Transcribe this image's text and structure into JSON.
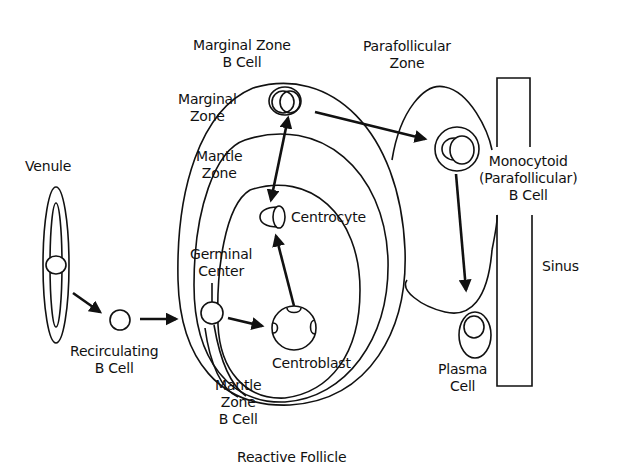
{
  "diagram": {
    "title": "Reactive Follicle",
    "labels": {
      "venule": "Venule",
      "recirculating_b_cell": [
        "Recirculating",
        "B Cell"
      ],
      "marginal_zone_b_cell": [
        "Marginal Zone",
        "B Cell"
      ],
      "marginal_zone": [
        "Marginal",
        "Zone"
      ],
      "mantle_zone": [
        "Mantle",
        "Zone"
      ],
      "germinal_center": [
        "Germinal",
        "Center"
      ],
      "centrocyte": "Centrocyte",
      "centroblast": "Centroblast",
      "mantle_zone_b_cell": [
        "Mantle",
        "Zone",
        "B Cell"
      ],
      "parafollicular_zone": [
        "Parafollicular",
        "Zone"
      ],
      "monocytoid_b_cell": [
        "Monocytoid",
        "(Parafollicular)",
        "B Cell"
      ],
      "sinus": "Sinus",
      "plasma_cell": [
        "Plasma",
        "Cell"
      ],
      "reactive_follicle": "Reactive Follicle"
    },
    "flow": [
      {
        "from": "Venule",
        "to": "Recirculating B Cell"
      },
      {
        "from": "Recirculating B Cell",
        "to": "Reactive Follicle"
      },
      {
        "from": "Germinal Center B Cell",
        "to": "Centroblast"
      },
      {
        "from": "Centroblast",
        "to": "Centrocyte"
      },
      {
        "from": "Marginal Zone B Cell",
        "to": "Centrocyte",
        "bidirectional": true
      },
      {
        "from": "Marginal Zone B Cell",
        "to": "Monocytoid (Parafollicular) B Cell"
      },
      {
        "from": "Monocytoid (Parafollicular) B Cell",
        "to": "Plasma Cell"
      }
    ],
    "colors": {
      "line": "#111111",
      "background": "#ffffff"
    }
  }
}
